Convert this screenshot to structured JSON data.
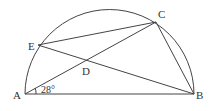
{
  "figure": {
    "type": "geometry-semicircle",
    "points": {
      "A": {
        "label": "A",
        "x": 25,
        "y": 94
      },
      "B": {
        "label": "B",
        "x": 194,
        "y": 94
      },
      "C": {
        "label": "C",
        "x": 156,
        "y": 22
      },
      "D": {
        "label": "D",
        "x": 86,
        "y": 62
      },
      "E": {
        "label": "E",
        "x": 38,
        "y": 45
      }
    },
    "segments": [
      "AB",
      "AC",
      "BC",
      "EC",
      "EB"
    ],
    "arc": "semicircle on diameter AB",
    "angle_mark": {
      "vertex": "A",
      "label": "28°",
      "between": [
        "AB",
        "AC"
      ]
    }
  }
}
